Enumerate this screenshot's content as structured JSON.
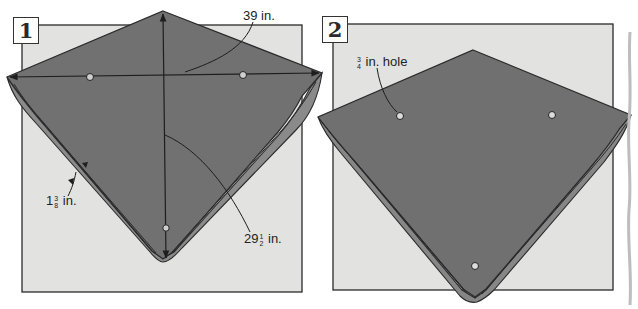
{
  "colors": {
    "background": "#ffffff",
    "backing_square": "#e2e2e0",
    "kite_face": "#727272",
    "kite_face_dark": "#5f5f5f",
    "kite_fold": "#8a8a8a",
    "outline": "#2a2a2a",
    "hole": "#d9d9d9",
    "divider": "#bdbdbd"
  },
  "panels": [
    {
      "step": "1",
      "backing_square": {
        "x": 22,
        "y": 25,
        "w": 280,
        "h": 267
      },
      "kite": {
        "top": [
          163,
          11
        ],
        "left": [
          7,
          77
        ],
        "right": [
          322,
          73
        ],
        "bottom": [
          163,
          262
        ]
      },
      "holes": [
        [
          90,
          77
        ],
        [
          243,
          75
        ],
        [
          166,
          228
        ]
      ],
      "labels": {
        "width": {
          "whole": "39",
          "unit": "in."
        },
        "hem": {
          "whole": "1",
          "num": "3",
          "den": "8",
          "unit": "in."
        },
        "height": {
          "whole": "29",
          "num": "1",
          "den": "2",
          "unit": "in."
        }
      }
    },
    {
      "step": "2",
      "backing_square": {
        "x": 333,
        "y": 24,
        "w": 280,
        "h": 266
      },
      "kite": {
        "top": [
          473,
          50
        ],
        "left": [
          318,
          117
        ],
        "right": [
          631,
          115
        ],
        "bottom": [
          475,
          302
        ]
      },
      "holes": [
        [
          400,
          116
        ],
        [
          552,
          115
        ],
        [
          475,
          266
        ]
      ],
      "labels": {
        "hole": {
          "num": "3",
          "den": "4",
          "unit": "in. hole"
        }
      }
    }
  ]
}
